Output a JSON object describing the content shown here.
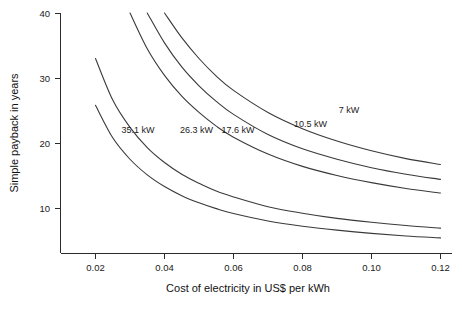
{
  "chart_data": {
    "type": "line",
    "title": "",
    "xlabel": "Cost of electricity in US$ per kWh",
    "ylabel": "Simple payback in years",
    "xlim": [
      0.012,
      0.125
    ],
    "ylim": [
      4.0,
      40.0
    ],
    "grid": false,
    "legend_position": "inline-labels",
    "xticks": [
      0.02,
      0.04,
      0.06,
      0.08,
      0.1,
      0.12
    ],
    "xtick_labels": [
      "0.02",
      "0.04",
      "0.06",
      "0.08",
      "0.10",
      "0.12"
    ],
    "yticks": [
      10,
      20,
      30,
      40
    ],
    "ytick_labels": [
      "10",
      "20",
      "30",
      "40"
    ],
    "x": [
      0.02,
      0.025,
      0.03,
      0.035,
      0.04,
      0.045,
      0.05,
      0.055,
      0.06,
      0.07,
      0.08,
      0.09,
      0.1,
      0.11,
      0.12
    ],
    "series": [
      {
        "name": "35.1 kW",
        "label": "35.1 kW",
        "label_x": 0.0275,
        "label_y": 21.6,
        "values": [
          25.8,
          20.8,
          17.5,
          15.1,
          13.3,
          11.9,
          10.8,
          9.9,
          9.15,
          8.0,
          7.2,
          6.6,
          6.1,
          5.7,
          5.4
        ]
      },
      {
        "name": "26.3 kW",
        "label": "26.3 kW",
        "label_x": 0.0445,
        "label_y": 21.6,
        "values": [
          33.0,
          26.6,
          22.4,
          19.3,
          17.0,
          15.2,
          13.8,
          12.6,
          11.7,
          10.2,
          9.2,
          8.4,
          7.8,
          7.3,
          6.9
        ]
      },
      {
        "name": "17.6 kW",
        "label": "17.6 kW",
        "label_x": 0.0565,
        "label_y": 21.6,
        "values": [
          null,
          null,
          40.0,
          34.5,
          30.4,
          27.2,
          24.7,
          22.6,
          20.9,
          18.3,
          16.4,
          15.0,
          13.9,
          13.0,
          12.3
        ]
      },
      {
        "name": "10.5 kW",
        "label": "10.5 kW",
        "label_x": 0.0775,
        "label_y": 22.4,
        "values": [
          null,
          null,
          null,
          40.0,
          35.4,
          31.7,
          28.8,
          26.4,
          24.4,
          21.3,
          19.1,
          17.5,
          16.2,
          15.2,
          14.4
        ]
      },
      {
        "name": "7 kW",
        "label": "7 kW",
        "label_x": 0.0905,
        "label_y": 24.6,
        "values": [
          null,
          null,
          null,
          null,
          40.0,
          36.2,
          33.0,
          30.3,
          28.1,
          24.7,
          22.2,
          20.3,
          18.8,
          17.6,
          16.7
        ]
      }
    ]
  },
  "axes": {
    "y_title": "Simple payback in years",
    "x_title": "Cost of electricity in US$ per kWh"
  }
}
